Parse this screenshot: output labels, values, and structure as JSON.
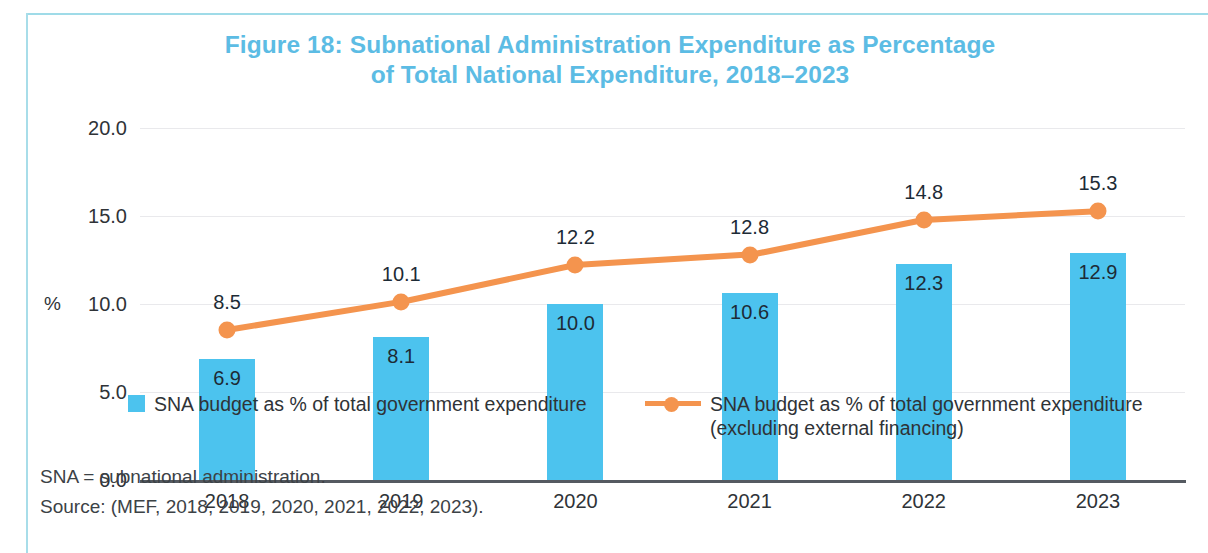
{
  "figure": {
    "title_line1": "Figure 18: Subnational Administration Expenditure as Percentage",
    "title_line2": "of Total National Expenditure, 2018–2023",
    "title_color": "#5cbce4",
    "frame_color": "#9fdbe8"
  },
  "notes": {
    "abbreviation": "SNA = subnational administration.",
    "source": "Source: (MEF, 2018, 2019, 2020, 2021, 2022, 2023)."
  },
  "legend": {
    "bar_label": "SNA budget as % of total government expenditure",
    "line_label_line1": "SNA budget as % of total government expenditure",
    "line_label_line2": "(excluding external financing)",
    "bar_color": "#4cc3ee",
    "line_color": "#f4944e"
  },
  "chart_data": {
    "type": "bar",
    "title": "Figure 18: Subnational Administration Expenditure as Percentage of Total National Expenditure, 2018–2023",
    "xlabel": "",
    "ylabel": "%",
    "ylim": [
      0.0,
      20.0
    ],
    "yticks": [
      0.0,
      5.0,
      10.0,
      15.0,
      20.0
    ],
    "ytick_labels": [
      "0.0",
      "5.0",
      "10.0",
      "15.0",
      "20.0"
    ],
    "grid": true,
    "legend_position": "bottom",
    "categories": [
      "2018",
      "2019",
      "2020",
      "2021",
      "2022",
      "2023"
    ],
    "series": [
      {
        "name": "SNA budget as % of total government expenditure",
        "type": "bar",
        "color": "#4cc3ee",
        "values": [
          6.9,
          8.1,
          10.0,
          10.6,
          12.3,
          12.9
        ],
        "value_labels": [
          "6.9",
          "8.1",
          "10.0",
          "10.6",
          "12.3",
          "12.9"
        ]
      },
      {
        "name": "SNA budget as % of total government expenditure (excluding external financing)",
        "type": "line",
        "color": "#f4944e",
        "values": [
          8.5,
          10.1,
          12.2,
          12.8,
          14.8,
          15.3
        ],
        "value_labels": [
          "8.5",
          "10.1",
          "12.2",
          "12.8",
          "14.8",
          "15.3"
        ]
      }
    ]
  }
}
